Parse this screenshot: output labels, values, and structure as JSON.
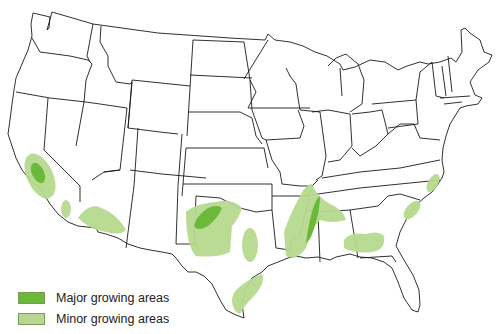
{
  "map": {
    "title": "United States",
    "colors": {
      "major": "#6cb83a",
      "minor": "#b5d98e",
      "outline": "#1a1a1a",
      "background": "#ffffff"
    }
  },
  "legend": {
    "items": [
      {
        "key": "major",
        "label": "Major growing areas",
        "color": "#6cb83a"
      },
      {
        "key": "minor",
        "label": "Minor growing areas",
        "color": "#b5d98e"
      }
    ]
  },
  "caption": {
    "text": ""
  }
}
